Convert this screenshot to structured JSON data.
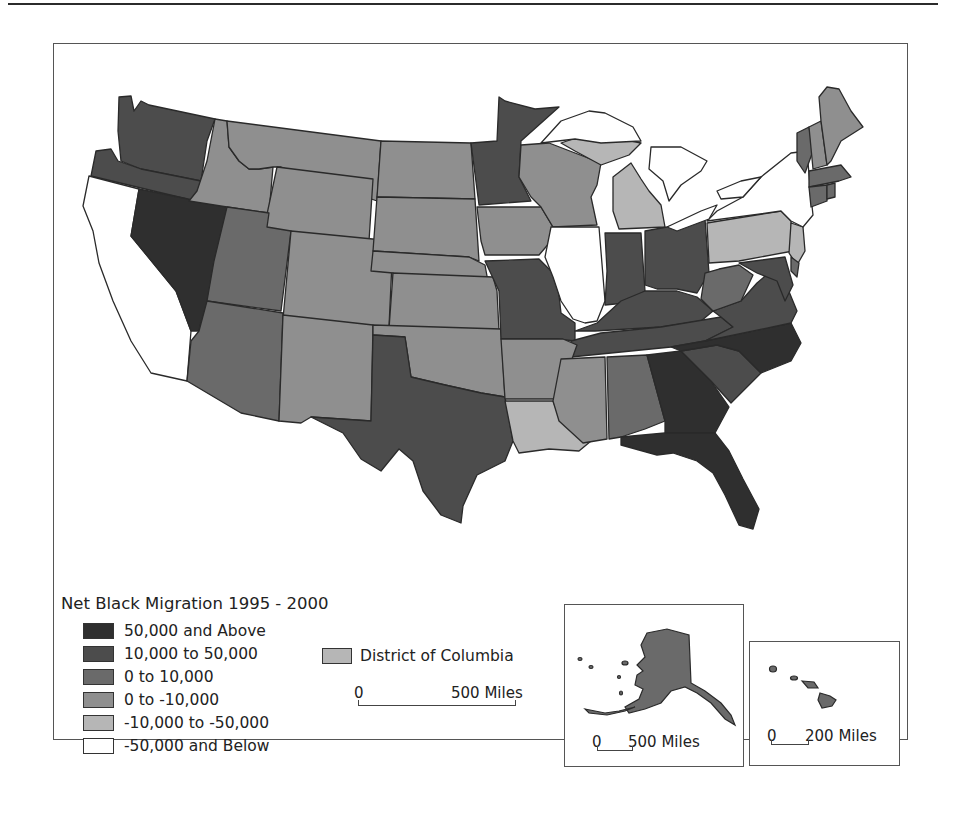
{
  "colors": {
    "c50k_above": "#2f2f2f",
    "c10k_50k": "#4c4c4c",
    "c0_10k": "#6a6a6a",
    "c0_neg10k": "#8f8f8f",
    "neg10k_neg50k": "#b6b6b6",
    "neg50k_below": "#ffffff",
    "outline": "#2a2a2a"
  },
  "legend": {
    "title": "Net Black Migration 1995 - 2000",
    "items": [
      {
        "label": "50,000 and Above",
        "color": "#2f2f2f"
      },
      {
        "label": "10,000 to 50,000",
        "color": "#4c4c4c"
      },
      {
        "label": "0 to 10,000",
        "color": "#6a6a6a"
      },
      {
        "label": "0 to -10,000",
        "color": "#8f8f8f"
      },
      {
        "label": "-10,000 to -50,000",
        "color": "#b6b6b6"
      },
      {
        "label": "-50,000 and Below",
        "color": "#ffffff"
      }
    ],
    "dc_label": "District of Columbia",
    "dc_color": "#b6b6b6"
  },
  "scale_main": {
    "zero": "0",
    "label": "500 Miles"
  },
  "inset_alaska": {
    "zero": "0",
    "label": "500 Miles"
  },
  "inset_hawaii": {
    "zero": "0",
    "label": "200 Miles"
  }
}
